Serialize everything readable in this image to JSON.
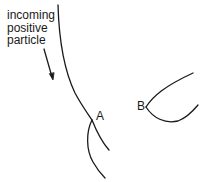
{
  "diagram": {
    "caption_lines": [
      "incoming",
      "positive",
      "particle"
    ],
    "labels": {
      "a": "A",
      "b": "B"
    },
    "colors": {
      "line": "#1a1a1a",
      "background": "#ffffff"
    }
  }
}
